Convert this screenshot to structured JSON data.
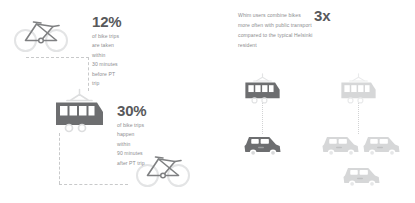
{
  "left_panel": {
    "stat_before": {
      "value": "12%",
      "line1": "of bike trips are taken within",
      "line2": "30 minutes before PT trip"
    },
    "stat_after": {
      "value": "30%",
      "line1": "of bike trips happen within",
      "line2": "90 minutes after PT trip"
    },
    "icons": {
      "bike_top": "bicycle-icon",
      "tram": "tram-icon",
      "bike_bottom": "bicycle-icon"
    }
  },
  "right_panel": {
    "headline": {
      "value": "3x",
      "line1": "Whim users combine bikes",
      "line2": "more often with public transport",
      "line3": "compared to the typical Helsinki",
      "line4": "resident"
    },
    "comparison": {
      "whim_group": {
        "tram": "tram-icon",
        "cars": [
          "car-icon"
        ]
      },
      "typical_group": {
        "tram": "tram-icon",
        "cars": [
          "car-icon",
          "car-icon",
          "car-icon"
        ]
      }
    }
  },
  "colors": {
    "dark_gray": "#6d6e70",
    "mid_gray": "#8c8d8f",
    "light_gray": "#d6d7d8",
    "pale_gray": "#e3e4e5",
    "heading": "#58595b",
    "dash": "#c8c9ca",
    "background": "#ffffff"
  }
}
